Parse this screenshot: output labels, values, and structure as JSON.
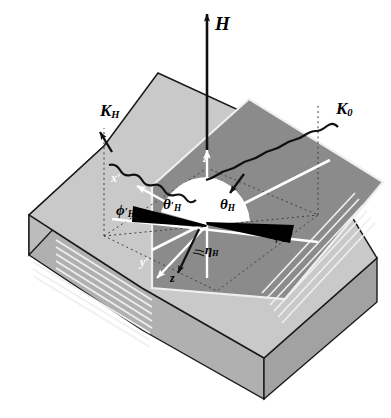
{
  "figure": {
    "type": "scattering-geometry-diagram",
    "colors": {
      "background": "#ffffff",
      "top_outer_face": "#c9c9c9",
      "top_inner_face": "#8b8b8b",
      "front_face": "#b4b4b4",
      "right_face": "#a8a8a8",
      "left_bevel_face": "#bdbdbd",
      "layer_stripe": "#efefef",
      "outline": "#1a1a1a",
      "wedge_theta": "#ffffff",
      "wedge_phi": "#000000",
      "axis_white": "#ffffff",
      "dotted_guide": "#4a4a4a"
    }
  },
  "labels": {
    "field": {
      "symbol": "H",
      "name": "applied-magnetic-field"
    },
    "k_incident": {
      "symbol": "K",
      "subscript": "0",
      "name": "incident-wave-vector"
    },
    "k_diffracted": {
      "symbol": "K",
      "subscript": "H",
      "name": "diffracted-wave-vector"
    },
    "axis_z_prime": {
      "symbol": "z",
      "prime": "′",
      "name": "lab-axis-z-prime"
    },
    "axis_x_prime": {
      "symbol": "x",
      "prime": "′",
      "name": "lab-axis-x-prime"
    },
    "axis_y_prime": {
      "symbol": "y",
      "prime": "′",
      "name": "lab-axis-y-prime"
    },
    "axis_z_hat": {
      "symbol": "z",
      "name": "sample-axis-z-hat"
    },
    "theta_H": {
      "symbol": "θ",
      "subscript": "H",
      "name": "scattering-polar-angle"
    },
    "theta_H_prime": {
      "symbol": "θ",
      "prime": "′",
      "subscript": "H",
      "name": "exit-polar-angle"
    },
    "phi_H": {
      "symbol": "ϕ",
      "subscript": "H",
      "name": "scattering-azimuthal-angle"
    },
    "phi_H_prime": {
      "symbol": "ϕ",
      "prime": "′",
      "subscript": "H",
      "name": "exit-azimuthal-angle"
    },
    "eta_H": {
      "symbol": "η",
      "subscript": "H",
      "name": "miscut-tilt-angle"
    }
  },
  "geometry": {
    "field_arrow": {
      "from": [
        207,
        143
      ],
      "to": [
        207,
        12
      ]
    },
    "z_prime_axis": {
      "from": [
        207,
        278
      ],
      "to": [
        207,
        145
      ]
    },
    "incident_beam_label_anchor": [
      352,
      112
    ],
    "diffracted_beam_label_anchor": [
      103,
      113
    ],
    "n_layer_stripes": 6
  }
}
